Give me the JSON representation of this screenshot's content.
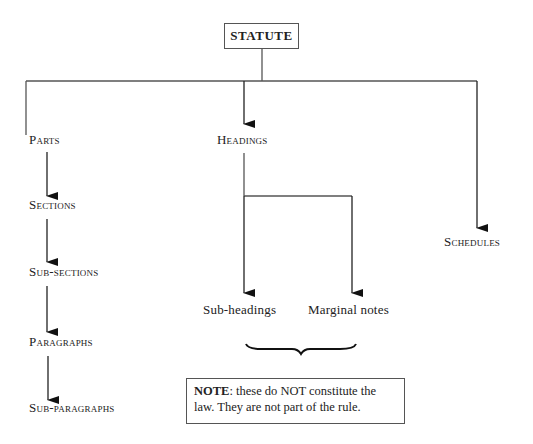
{
  "diagram": {
    "root": {
      "label": "STATUTE"
    },
    "branches": {
      "left": {
        "chain": [
          {
            "label": "Parts"
          },
          {
            "label": "Sections"
          },
          {
            "label": "Sub-sections"
          },
          {
            "label": "Paragraphs"
          },
          {
            "label": "Sub-paragraphs"
          }
        ]
      },
      "middle": {
        "label": "Headings",
        "children": [
          {
            "label": "Sub-headings"
          },
          {
            "label": "Marginal notes"
          }
        ]
      },
      "right": {
        "label": "Schedules"
      }
    },
    "note": {
      "prefix": "NOTE",
      "text": ": these do NOT constitute the law. They are not part of the rule."
    }
  },
  "colors": {
    "line": "#555555",
    "arrow": "#111111",
    "text": "#222222"
  }
}
